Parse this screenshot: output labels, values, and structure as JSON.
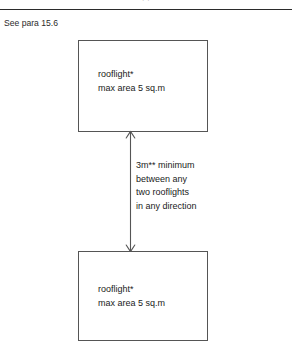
{
  "page": {
    "running_header_cut": "· ·",
    "caption": "See para 15.6"
  },
  "diagram": {
    "top_rooflight": {
      "line1": "rooflight*",
      "line2": "max area 5 sq.m"
    },
    "bottom_rooflight": {
      "line1": "rooflight*",
      "line2": "max area 5 sq.m"
    },
    "dimension_note": {
      "line1": "3m** minimum",
      "line2": "between any",
      "line3": "two rooflights",
      "line4": "in any direction"
    }
  },
  "colors": {
    "rule": "#2b2b2b",
    "box_stroke": "#555555",
    "arrow": "#555555",
    "text": "#1a1a1a",
    "background": "#ffffff"
  }
}
